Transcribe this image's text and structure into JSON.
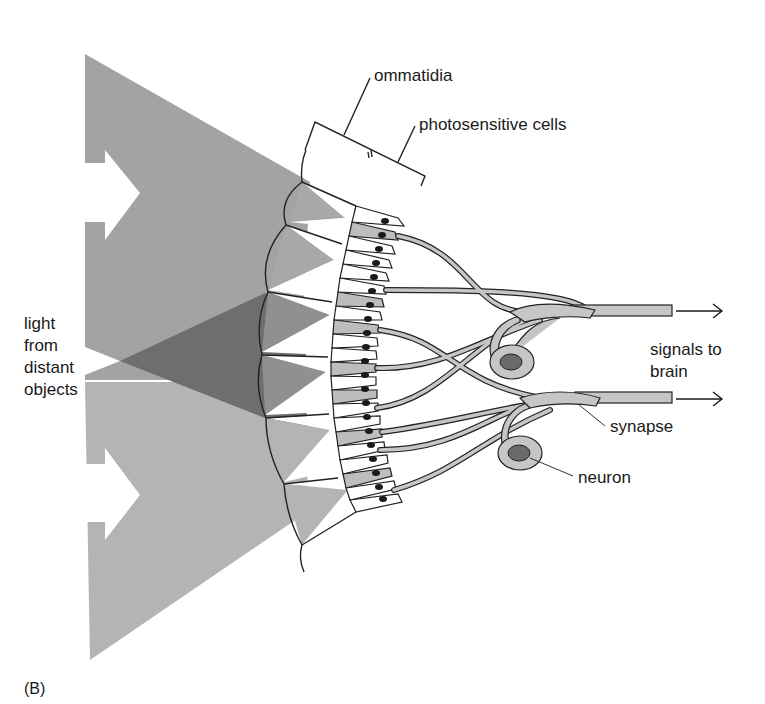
{
  "figure": {
    "panel_label": "(B)"
  },
  "labels": {
    "ommatidia": "ommatidia",
    "photosensitive_cells": "photosensitive cells",
    "light_line1": "light",
    "light_line2": "from",
    "light_line3": "distant",
    "light_line4": "objects",
    "signals_line1": "signals to",
    "signals_line2": "brain",
    "synapse": "synapse",
    "neuron": "neuron"
  },
  "colors": {
    "light_cone": "#a3a3a3",
    "light_cone_lower": "#b4b4b4",
    "overlap_dark": "#6e6e6e",
    "cell_fill": "#bdbdbd",
    "nerve_fill": "#c6c6c6",
    "nucleus": "#6a6a6a",
    "outline": "#222222"
  },
  "structure": {
    "ommatidia_count": 6,
    "photoreceptor_count": 22,
    "output_nerves": 2,
    "neurons": 2
  }
}
